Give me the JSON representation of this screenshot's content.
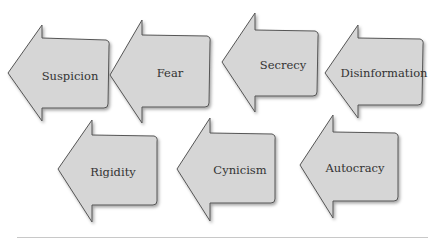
{
  "diagram": {
    "type": "arrow-sequence",
    "direction": "right-to-left",
    "colors": {
      "arrow_fill": "#d6d6d6",
      "arrow_stroke": "#555555",
      "text": "#333333",
      "rule": "#cccccc"
    },
    "rows": [
      {
        "arrows": [
          {
            "label": "Suspicion"
          },
          {
            "label": "Fear"
          },
          {
            "label": "Secrecy"
          },
          {
            "label": "Disinformation"
          }
        ]
      },
      {
        "arrows": [
          {
            "label": "Rigidity"
          },
          {
            "label": "Cynicism"
          },
          {
            "label": "Autocracy"
          }
        ]
      }
    ]
  }
}
